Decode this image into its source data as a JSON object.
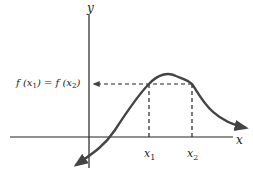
{
  "diagram": {
    "axis_labels": {
      "x": "x",
      "y": "y"
    },
    "tick_labels": {
      "x1": "x",
      "x1_sub": "1",
      "x2": "x",
      "x2_sub": "2"
    },
    "equation": {
      "f1": "f (x",
      "sub1": "1",
      "mid": ") = f (x",
      "sub2": "2",
      "end": ")"
    },
    "colors": {
      "curve": "#444444",
      "axis": "#222222"
    }
  }
}
